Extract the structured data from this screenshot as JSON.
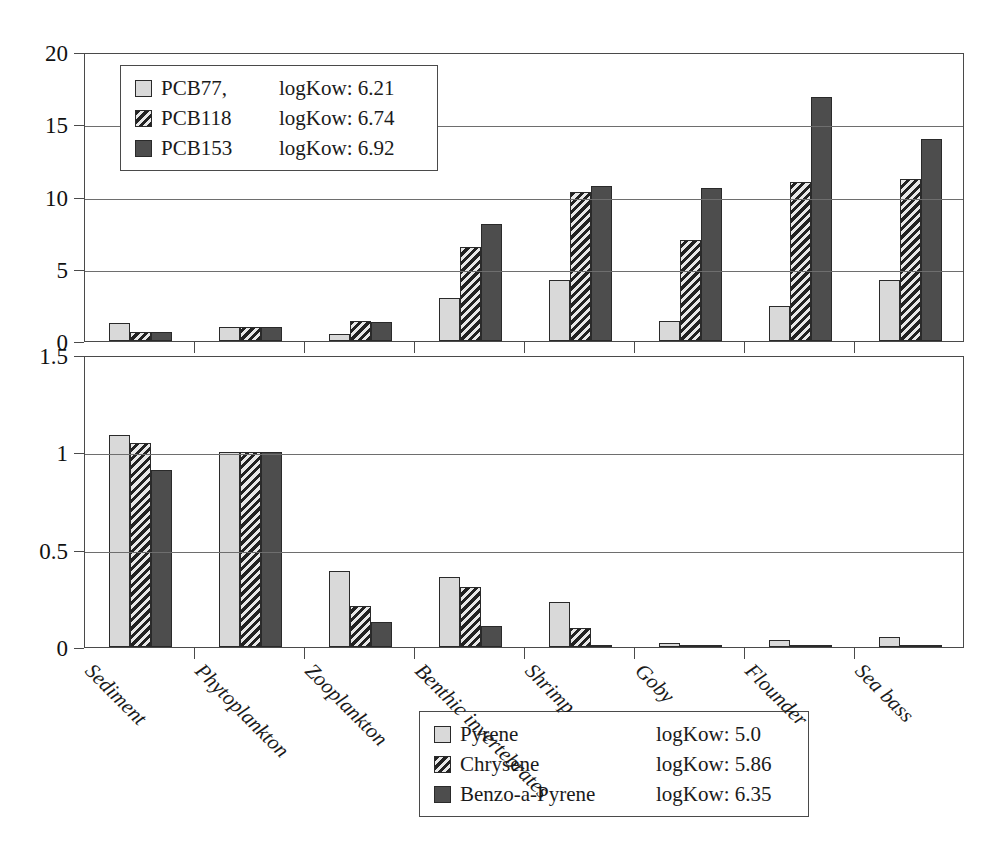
{
  "chart_data": [
    {
      "type": "bar",
      "panel": "top",
      "title": "",
      "xlabel": "",
      "ylabel": "",
      "ylim": [
        0,
        20
      ],
      "yticks": [
        "0",
        "5",
        "10",
        "15",
        "20"
      ],
      "ytick_values": [
        0,
        5,
        10,
        15,
        20
      ],
      "grid": true,
      "legend_position": "top-left-inside",
      "categories": [
        "Sediment",
        "Phytoplankton",
        "Zooplankton",
        "Benthic invertebrates",
        "Shrimp",
        "Goby",
        "Flounder",
        "Sea bass"
      ],
      "series": [
        {
          "name": "PCB77,",
          "kow_label": "logKow: 6.21",
          "logKow": 6.21,
          "values": [
            1.25,
            1.0,
            0.5,
            3.0,
            4.2,
            1.4,
            2.4,
            4.2
          ]
        },
        {
          "name": "PCB118",
          "kow_label": "logKow: 6.74",
          "logKow": 6.74,
          "values": [
            0.6,
            1.0,
            1.4,
            6.5,
            10.3,
            7.0,
            11.0,
            11.2
          ]
        },
        {
          "name": "PCB153",
          "kow_label": "logKow: 6.92",
          "logKow": 6.92,
          "values": [
            0.6,
            1.0,
            1.3,
            8.1,
            10.7,
            10.6,
            16.9,
            14.0
          ]
        }
      ]
    },
    {
      "type": "bar",
      "panel": "bottom",
      "title": "",
      "xlabel": "",
      "ylabel": "",
      "ylim": [
        0,
        1.5
      ],
      "yticks": [
        "0",
        "0.5",
        "1",
        "1.5"
      ],
      "ytick_values": [
        0,
        0.5,
        1,
        1.5
      ],
      "grid": true,
      "legend_position": "top-right-inside",
      "categories": [
        "Sediment",
        "Phytoplankton",
        "Zooplankton",
        "Benthic invertebrates",
        "Shrimp",
        "Goby",
        "Flounder",
        "Sea bass"
      ],
      "series": [
        {
          "name": "Pyrene",
          "kow_label": "logKow: 5.0",
          "logKow": 5.0,
          "values": [
            1.09,
            1.0,
            0.39,
            0.36,
            0.23,
            0.02,
            0.035,
            0.05
          ]
        },
        {
          "name": "Chrysene",
          "kow_label": "logKow: 5.86",
          "logKow": 5.86,
          "values": [
            1.05,
            1.0,
            0.21,
            0.31,
            0.1,
            0.012,
            0.006,
            0.006
          ]
        },
        {
          "name": "Benzo-a-Pyrene",
          "kow_label": "logKow: 6.35",
          "logKow": 6.35,
          "values": [
            0.91,
            1.0,
            0.13,
            0.11,
            0.012,
            0.004,
            0.003,
            0.003
          ]
        }
      ]
    }
  ],
  "colors": {
    "series_1_fill": "#d9d9d9",
    "series_2_fill": "#3a3a3a",
    "series_3_fill": "#4d4d4d",
    "axis": "#4a4a4a",
    "grid": "#6e6e6e",
    "background": "#ffffff"
  }
}
